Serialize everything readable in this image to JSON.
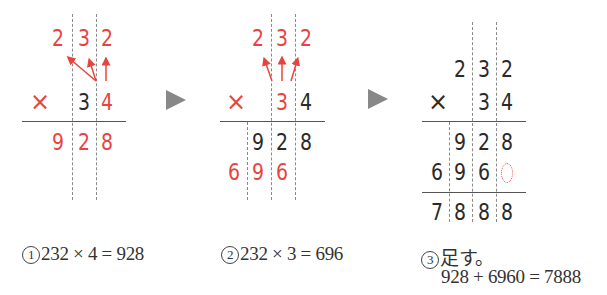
{
  "colors": {
    "highlight": "#e8443f",
    "text": "#2a2a2a",
    "guide": "#8a8a8a",
    "arrow_gray": "#888888"
  },
  "steps": [
    {
      "multiplicand": [
        "2",
        "3",
        "2"
      ],
      "operator": "×",
      "multiplier": [
        "3",
        "4"
      ],
      "partial1": [
        "9",
        "2",
        "8"
      ],
      "caption_num": "1",
      "caption_text": "232 × 4 = 928",
      "highlighted_digit": "4"
    },
    {
      "multiplicand": [
        "2",
        "3",
        "2"
      ],
      "operator": "×",
      "multiplier": [
        "3",
        "4"
      ],
      "partial1": [
        "9",
        "2",
        "8"
      ],
      "partial2": [
        "6",
        "9",
        "6"
      ],
      "caption_num": "2",
      "caption_text": "232 × 3 = 696",
      "highlighted_digit": "3"
    },
    {
      "multiplicand": [
        "2",
        "3",
        "2"
      ],
      "operator": "×",
      "multiplier": [
        "3",
        "4"
      ],
      "partial1": [
        "9",
        "2",
        "8"
      ],
      "partial2": [
        "6",
        "9",
        "6"
      ],
      "sum": [
        "7",
        "8",
        "8",
        "8"
      ],
      "caption_num": "3",
      "caption_text": "足す。",
      "caption_line2": "928 + 6960 = 7888"
    }
  ],
  "transition_icon": "play-arrow-icon"
}
